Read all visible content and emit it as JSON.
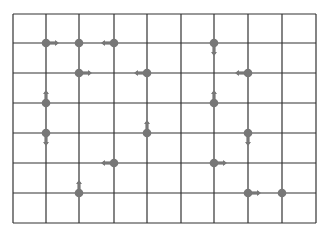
{
  "diagram": {
    "type": "grid-vector-field",
    "grid": {
      "cols": 9,
      "rows": 7,
      "x_lines": [
        13,
        46,
        79,
        114,
        147,
        181,
        214,
        248,
        282,
        316
      ],
      "y_lines": [
        14,
        43,
        73,
        103,
        133,
        163,
        193,
        223
      ],
      "line_color": "#333333",
      "line_width": 1.2
    },
    "node_color": "#777777",
    "arrow_color": "#777777",
    "nodes": [
      {
        "col": 1,
        "row": 1,
        "arrow": "right"
      },
      {
        "col": 2,
        "row": 1,
        "arrow": "none"
      },
      {
        "col": 3,
        "row": 1,
        "arrow": "left"
      },
      {
        "col": 6,
        "row": 1,
        "arrow": "down"
      },
      {
        "col": 2,
        "row": 2,
        "arrow": "right"
      },
      {
        "col": 4,
        "row": 2,
        "arrow": "left"
      },
      {
        "col": 7,
        "row": 2,
        "arrow": "left"
      },
      {
        "col": 1,
        "row": 3,
        "arrow": "up"
      },
      {
        "col": 6,
        "row": 3,
        "arrow": "up"
      },
      {
        "col": 1,
        "row": 4,
        "arrow": "down"
      },
      {
        "col": 4,
        "row": 4,
        "arrow": "up"
      },
      {
        "col": 7,
        "row": 4,
        "arrow": "down"
      },
      {
        "col": 3,
        "row": 5,
        "arrow": "left"
      },
      {
        "col": 6,
        "row": 5,
        "arrow": "right"
      },
      {
        "col": 2,
        "row": 6,
        "arrow": "up"
      },
      {
        "col": 7,
        "row": 6,
        "arrow": "right"
      },
      {
        "col": 8,
        "row": 6,
        "arrow": "none"
      }
    ]
  }
}
